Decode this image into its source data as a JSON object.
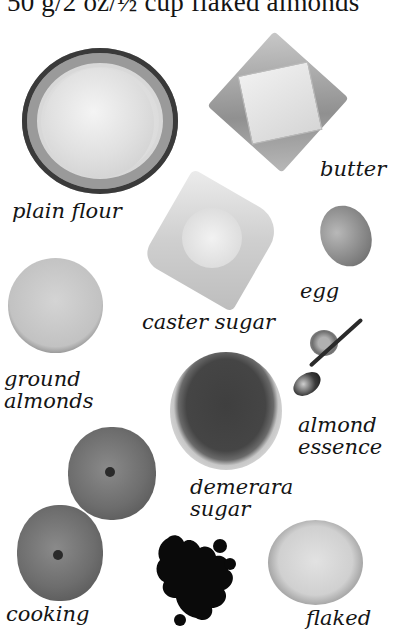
{
  "page": {
    "top_text": "50 g/2 oz/½ cup flaked almonds"
  },
  "ingredients": {
    "plain_flour": "plain flour",
    "butter": "butter",
    "caster_sugar": "caster sugar",
    "egg": "egg",
    "ground_almonds": [
      "ground",
      "almonds"
    ],
    "almond_essence": [
      "almond",
      "essence"
    ],
    "demerara_sugar": [
      "demerara",
      "sugar"
    ],
    "cooking_apples": "cooking",
    "flaked_almonds": "flaked"
  }
}
